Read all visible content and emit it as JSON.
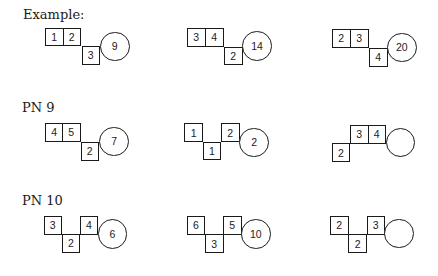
{
  "sections": [
    {
      "id": "example",
      "label": "Example:",
      "label_pos": {
        "x": 23,
        "y": 8
      },
      "puzzles": [
        {
          "cells": [
            {
              "value": "1",
              "x": 45,
              "y": 27.5
            },
            {
              "value": "2",
              "x": 62.5,
              "y": 27.5
            },
            {
              "value": "3",
              "x": 81.5,
              "y": 46
            }
          ],
          "circle": {
            "value": "9",
            "x": 100,
            "y": 31.5
          }
        },
        {
          "cells": [
            {
              "value": "3",
              "x": 187,
              "y": 28
            },
            {
              "value": "4",
              "x": 205,
              "y": 28
            },
            {
              "value": "2",
              "x": 224,
              "y": 46.5
            }
          ],
          "circle": {
            "value": "14",
            "x": 242.3,
            "y": 31
          }
        },
        {
          "cells": [
            {
              "value": "2",
              "x": 332,
              "y": 29
            },
            {
              "value": "3",
              "x": 350,
              "y": 29
            },
            {
              "value": "4",
              "x": 369,
              "y": 48
            }
          ],
          "circle": {
            "value": "20",
            "x": 387,
            "y": 32.5
          }
        }
      ]
    },
    {
      "id": "pn9",
      "label": "PN 9",
      "label_pos": {
        "x": 22,
        "y": 101
      },
      "puzzles": [
        {
          "cells": [
            {
              "value": "4",
              "x": 45,
              "y": 123
            },
            {
              "value": "5",
              "x": 62,
              "y": 123
            },
            {
              "value": "2",
              "x": 80.5,
              "y": 142
            }
          ],
          "circle": {
            "value": "7",
            "x": 99.3,
            "y": 126.7
          }
        },
        {
          "cells": [
            {
              "value": "1",
              "x": 184.3,
              "y": 123.3
            },
            {
              "value": "1",
              "x": 202.7,
              "y": 141.7
            },
            {
              "value": "2",
              "x": 221,
              "y": 123.3
            }
          ],
          "circle": {
            "value": "2",
            "x": 239.3,
            "y": 127.5
          }
        },
        {
          "cells": [
            {
              "value": "2",
              "x": 331.7,
              "y": 143.3
            },
            {
              "value": "3",
              "x": 350,
              "y": 125
            },
            {
              "value": "4",
              "x": 367.5,
              "y": 125
            }
          ],
          "circle": {
            "value": "",
            "x": 385.7,
            "y": 127.5
          }
        }
      ]
    },
    {
      "id": "pn10",
      "label": "PN 10",
      "label_pos": {
        "x": 22,
        "y": 194
      },
      "puzzles": [
        {
          "cells": [
            {
              "value": "3",
              "x": 43.5,
              "y": 216
            },
            {
              "value": "2",
              "x": 61.7,
              "y": 234
            },
            {
              "value": "4",
              "x": 79.7,
              "y": 216
            }
          ],
          "circle": {
            "value": "6",
            "x": 97.7,
            "y": 219
          }
        },
        {
          "cells": [
            {
              "value": "6",
              "x": 186.7,
              "y": 216
            },
            {
              "value": "3",
              "x": 205,
              "y": 234.3
            },
            {
              "value": "5",
              "x": 223,
              "y": 216
            }
          ],
          "circle": {
            "value": "10",
            "x": 241,
            "y": 219
          }
        },
        {
          "cells": [
            {
              "value": "2",
              "x": 330,
              "y": 216
            },
            {
              "value": "2",
              "x": 348.3,
              "y": 234.3
            },
            {
              "value": "3",
              "x": 366.5,
              "y": 216
            }
          ],
          "circle": {
            "value": "",
            "x": 384.3,
            "y": 218.5
          }
        }
      ]
    }
  ]
}
